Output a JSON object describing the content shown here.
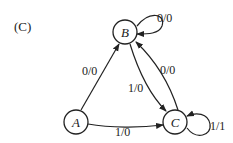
{
  "panel_label": "(C)",
  "nodes": {
    "A": {
      "label": "A"
    },
    "B": {
      "label": "B"
    },
    "C": {
      "label": "C"
    }
  },
  "edges": {
    "B_self": {
      "from": "B",
      "to": "B",
      "label": "0/0"
    },
    "A_to_B": {
      "from": "A",
      "to": "B",
      "label": "0/0"
    },
    "B_to_C": {
      "from": "B",
      "to": "C",
      "label": "1/0"
    },
    "C_to_B": {
      "from": "C",
      "to": "B",
      "label": "0/0"
    },
    "A_to_C": {
      "from": "A",
      "to": "C",
      "label": "1/0"
    },
    "C_self": {
      "from": "C",
      "to": "C",
      "label": "1/1"
    }
  }
}
